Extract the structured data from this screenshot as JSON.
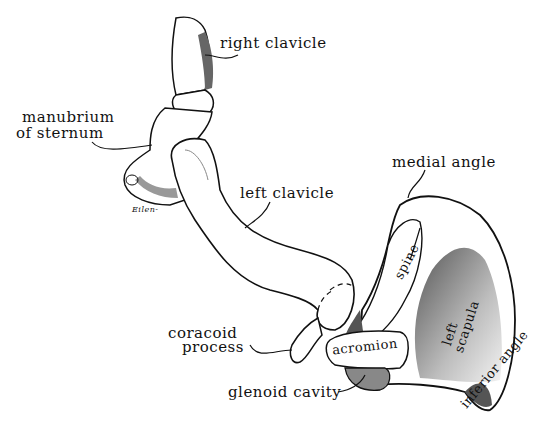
{
  "figure": {
    "colors": {
      "ink": "#111111",
      "shade": "#777777",
      "paper": "#ffffff"
    }
  },
  "labels": {
    "right_clavicle": "right clavicle",
    "manubrium_line1": "manubrium",
    "manubrium_line2": "of sternum",
    "left_clavicle": "left clavicle",
    "medial_angle": "medial angle",
    "spine": "spine",
    "left_scapula_line1": "left",
    "left_scapula_line2": "scapula",
    "coracoid_line1": "coracoid",
    "coracoid_line2": "process",
    "acromion": "acromion",
    "glenoid_cavity": "glenoid cavity",
    "inferior_angle": "inferior angle",
    "signature": "Eilen-"
  }
}
